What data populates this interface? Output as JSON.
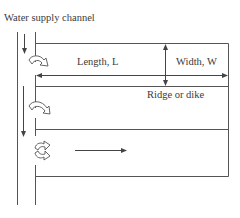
{
  "diagram": {
    "type": "basin irrigation layout",
    "labels": {
      "supply_channel": "Water supply channel",
      "length": "Length, L",
      "width": "Width, W",
      "ridge": "Ridge or dike"
    },
    "colors": {
      "line": "#555555",
      "text": "#3a3a3a",
      "background": "#ffffff"
    },
    "elements": {
      "basins": 3,
      "supply_flow_arrows": 2,
      "inlet_turnouts": 3,
      "basin_flow_arrow": 1
    }
  }
}
